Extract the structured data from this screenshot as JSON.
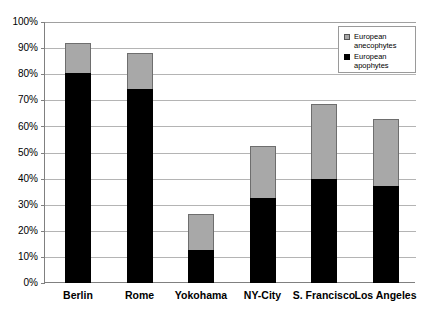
{
  "chart_data": {
    "type": "bar",
    "stacked": true,
    "title": "",
    "xlabel": "",
    "ylabel": "",
    "ylim": [
      0,
      100
    ],
    "ytick_labels": [
      "100%",
      "90%",
      "80%",
      "70%",
      "60%",
      "50%",
      "40%",
      "30%",
      "20%",
      "10%",
      "0%"
    ],
    "ytick_values": [
      100,
      90,
      80,
      70,
      60,
      50,
      40,
      30,
      20,
      10,
      0
    ],
    "grid": true,
    "legend_position": "top-right",
    "categories": [
      "Berlin",
      "Rome",
      "Yokohama",
      "NY-City",
      "S. Francisco",
      "Los Angeles"
    ],
    "series": [
      {
        "name": "European apophytes",
        "color": "#000000",
        "values": [
          80.5,
          74.5,
          12.5,
          32.5,
          40.0,
          37.0
        ]
      },
      {
        "name": "European anecophytes",
        "color": "#a8a8a8",
        "values": [
          11.5,
          13.5,
          14.0,
          20.0,
          28.5,
          26.0
        ]
      }
    ],
    "totals": [
      92.0,
      88.0,
      26.5,
      52.5,
      68.5,
      63.0
    ]
  },
  "legend": {
    "entries": [
      {
        "label": "European anecophytes",
        "swatch": "gray-square-icon"
      },
      {
        "label": "European apophytes",
        "swatch": "black-square-icon"
      }
    ]
  },
  "colors": {
    "anecophytes": "#a8a8a8",
    "apophytes": "#000000",
    "gridline": "#b4b4b4",
    "axis": "#808080",
    "background": "#ffffff"
  }
}
